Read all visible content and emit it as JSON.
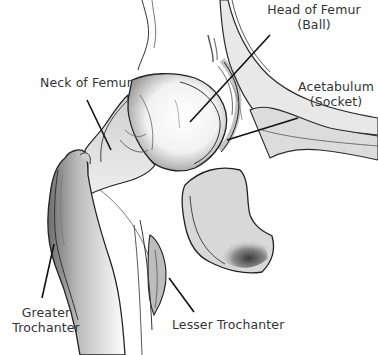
{
  "figure": {
    "labels": {
      "head_of_femur": {
        "line1": "Head of Femur",
        "line2": "(Ball)"
      },
      "neck_of_femur": {
        "line1": "Neck of Femur"
      },
      "acetabulum": {
        "line1": "Acetabulum",
        "line2": "(Socket)"
      },
      "greater_trochanter": {
        "line1": "Greater",
        "line2": "Trochanter"
      },
      "lesser_trochanter": {
        "line1": "Lesser Trochanter"
      }
    },
    "colors": {
      "background": "#ffffff",
      "ink": "#1a1a1a",
      "label_text": "#333333",
      "shade_dark": "#555555",
      "shade_mid": "#999999",
      "shade_light": "#d9d9d9"
    }
  }
}
